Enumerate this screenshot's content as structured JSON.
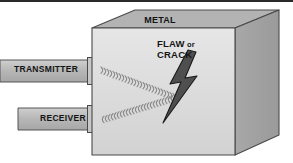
{
  "figure": {
    "background_color": "#ffffff",
    "rule_color": "#2a2a2a"
  },
  "labels": {
    "metal": "METAL",
    "flaw_line1": "FLAW",
    "flaw_or": "or",
    "flaw_line2": "CRACK",
    "transmitter": "TRANSMITTER",
    "receiver": "RECEIVER"
  },
  "colors": {
    "cube_front": "#dcdcdc",
    "cube_top": "#b3b3b3",
    "cube_side": "#a0a0a0",
    "cube_outline": "#4a4a4a",
    "bar_fill": "#b5b5b5",
    "bar_outline": "#555555",
    "probe_fill": "#c8c8c8",
    "wave": "#8c8c8c",
    "bolt_fill": "#4d4d4d",
    "bolt_outline": "#1a1a1a",
    "text": "#141414"
  },
  "geometry": {
    "cube": {
      "front": "92,28 92,155 235,155 235,28",
      "top": "92,28 135,10 279,10 235,28",
      "side": "235,28 279,10 279,135 235,155"
    },
    "transmitter_bar": "0,60 93,60 93,82 0,82",
    "receiver_bar": "18,108 93,108 93,130 18,130",
    "transmitter_probe": "88,58 99,58 99,84 88,84",
    "receiver_probe": "88,106 99,106 99,132 88,132",
    "transmitter_wave": {
      "from": "100,70",
      "to": "178,100",
      "arc_count": 26,
      "direction": "forward"
    },
    "receiver_wave": {
      "from": "100,119",
      "to": "180,96",
      "arc_count": 26,
      "direction": "backward"
    },
    "bolt": "171,52 160,86 172,84 161,122 194,75 181,77 193,48"
  },
  "icons": {
    "wave_transmit": "ultrasound-wave-outgoing-icon",
    "wave_receive": "ultrasound-wave-returning-icon",
    "flaw": "lightning-bolt-flaw-icon"
  }
}
